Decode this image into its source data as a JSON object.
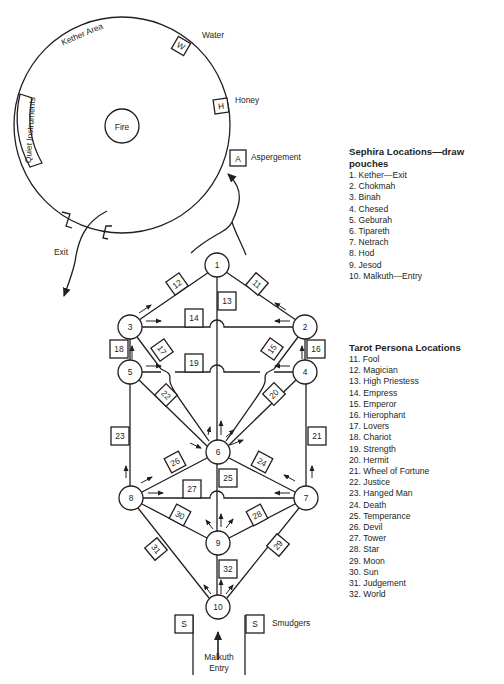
{
  "kether_area": {
    "title": "Kether Area",
    "center": "Fire",
    "stations": [
      {
        "code": "W",
        "label": "Water"
      },
      {
        "code": "H",
        "label": "Honey"
      },
      {
        "code": "A",
        "label": "Aspergement"
      }
    ],
    "quiet_instruments": "Quiet Instruments",
    "exit_label": "Exit"
  },
  "tree": {
    "sephira_nodes": [
      "1",
      "2",
      "3",
      "4",
      "5",
      "6",
      "7",
      "8",
      "9",
      "10"
    ],
    "path_labels": [
      "11",
      "12",
      "13",
      "14",
      "15",
      "16",
      "17",
      "18",
      "19",
      "20",
      "21",
      "22",
      "23",
      "24",
      "25",
      "26",
      "27",
      "28",
      "29",
      "30",
      "31",
      "32"
    ],
    "smudger_code": "S",
    "smudgers_label": "Smudgers",
    "entry_label_line1": "Malkuth",
    "entry_label_line2": "Entry"
  },
  "sephira_legend": {
    "title": "Sephira Locations—draw pouches",
    "items": [
      "1. Kether—Exit",
      "2. Chokmah",
      "3. Binah",
      "4. Chesed",
      "5. Geburah",
      "6. Tipareth",
      "7. Netrach",
      "8. Hod",
      "9. Jesod",
      "10. Malkuth—Entry"
    ]
  },
  "tarot_legend": {
    "title": "Tarot Persona Locations",
    "items": [
      "11. Fool",
      "12. Magician",
      "13. High Priestess",
      "14. Empress",
      "15. Emperor",
      "16. Hierophant",
      "17. Lovers",
      "18. Chariot",
      "19. Strength",
      "20. Hermit",
      "21. Wheel of Fortune",
      "22. Justice",
      "23. Hanged Man",
      "24. Death",
      "25. Temperance",
      "26. Devil",
      "27. Tower",
      "28. Star",
      "29. Moon",
      "30. Sun",
      "31. Judgement",
      "32. World"
    ]
  },
  "colors": {
    "ink": "#231f20",
    "background": "#ffffff"
  }
}
